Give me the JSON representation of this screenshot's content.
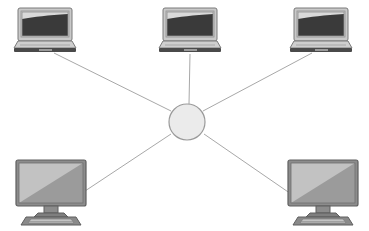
{
  "diagram": {
    "title": "Star network topology",
    "type": "network-topology",
    "background_color": "#ffffff",
    "width": 369,
    "height": 231,
    "palette": {
      "link_line": "#a8a8a8",
      "hub_fill": "#ebebeb",
      "hub_stroke": "#9a9a9a",
      "device_outline": "#6e6e6e",
      "laptop_bezel": "#bdbdbd",
      "laptop_bezel_light": "#d6d6d6",
      "laptop_screen_light": "#d9d9d9",
      "laptop_screen_dark": "#3a3a3a",
      "laptop_base": "#c9c9c9",
      "laptop_base_edge": "#4a4a4a",
      "monitor_bezel": "#8c8c8c",
      "monitor_screen_light": "#c2c2c2",
      "monitor_screen_dark": "#9b9b9b",
      "monitor_stand": "#8c8c8c",
      "keyboard_body": "#8a8a8a",
      "keyboard_keys": "#c4c4c4"
    },
    "hub": {
      "name": "central-hub",
      "label": "Hub",
      "cx": 187,
      "cy": 122,
      "r": 18
    },
    "nodes": [
      {
        "id": "laptop-top-left",
        "label": "Laptop 1",
        "device_type": "laptop",
        "x": 14,
        "y": 8,
        "width": 62,
        "height": 45
      },
      {
        "id": "laptop-top-center",
        "label": "Laptop 2",
        "device_type": "laptop",
        "x": 159,
        "y": 8,
        "width": 62,
        "height": 45
      },
      {
        "id": "laptop-top-right",
        "label": "Laptop 3",
        "device_type": "laptop",
        "x": 290,
        "y": 8,
        "width": 62,
        "height": 45
      },
      {
        "id": "desktop-bottom-left",
        "label": "Desktop 1",
        "device_type": "desktop",
        "x": 16,
        "y": 160,
        "width": 70,
        "height": 65
      },
      {
        "id": "desktop-bottom-right",
        "label": "Desktop 2",
        "device_type": "desktop",
        "x": 288,
        "y": 160,
        "width": 70,
        "height": 65
      }
    ],
    "links": [
      {
        "id": "link-hub-laptop-top-left",
        "from": "central-hub",
        "to": "laptop-top-left",
        "x1": 171,
        "y1": 111,
        "x2": 54,
        "y2": 53
      },
      {
        "id": "link-hub-laptop-top-center",
        "from": "central-hub",
        "to": "laptop-top-center",
        "x1": 189,
        "y1": 104,
        "x2": 190,
        "y2": 54
      },
      {
        "id": "link-hub-laptop-top-right",
        "from": "central-hub",
        "to": "laptop-top-right",
        "x1": 203,
        "y1": 111,
        "x2": 312,
        "y2": 53
      },
      {
        "id": "link-hub-desktop-bottom-left",
        "from": "central-hub",
        "to": "desktop-bottom-left",
        "x1": 171,
        "y1": 134,
        "x2": 79,
        "y2": 195
      },
      {
        "id": "link-hub-desktop-bottom-right",
        "from": "central-hub",
        "to": "desktop-bottom-right",
        "x1": 204,
        "y1": 134,
        "x2": 294,
        "y2": 196
      }
    ]
  }
}
